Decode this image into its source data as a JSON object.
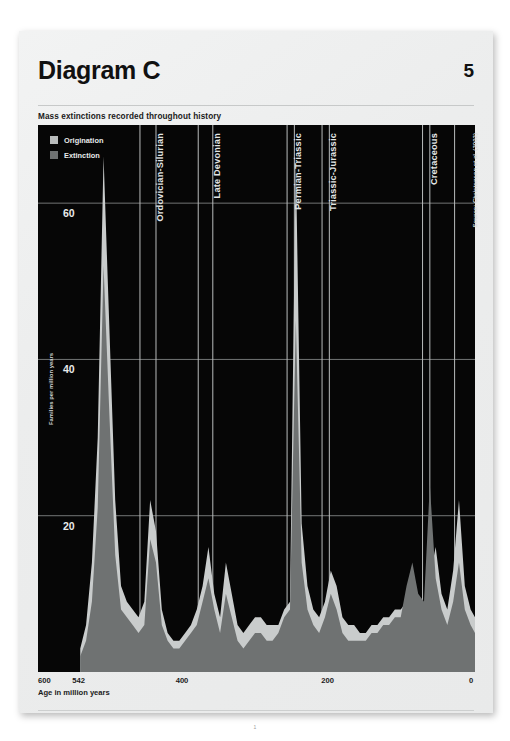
{
  "document": {
    "title": "Diagram C",
    "page_number": "5",
    "subtitle": "Mass extinctions recorded throughout history",
    "footer_page": "1"
  },
  "legend": {
    "items": [
      {
        "label": "Origination",
        "color": "#b9bcbc"
      },
      {
        "label": "Extinction",
        "color": "#6f7272"
      }
    ]
  },
  "annotations": {
    "source": "Source: Christensen et al. (2002)"
  },
  "colors": {
    "plot_background": "#060606",
    "gridline": "#8f9292",
    "band_separator": "#b9bcbc",
    "origination_fill": "#c9cccc",
    "extinction_fill": "#6f7272",
    "page_background": "#eceded",
    "text_dark": "#111111",
    "text_light": "#e4e6e6"
  },
  "chart_data": {
    "type": "area",
    "title": "Mass extinctions recorded throughout history",
    "xlabel": "Age in million years",
    "ylabel": "Families per million years",
    "xlim": [
      600,
      0
    ],
    "ylim": [
      0,
      70
    ],
    "x_reversed": true,
    "grid": "horizontal-and-vertical",
    "legend_position": "top-left-inside",
    "xticks": [
      600,
      542,
      400,
      200,
      0
    ],
    "yticks": [
      20,
      40,
      60
    ],
    "event_bands": [
      {
        "label": "Ordovician-Silurian",
        "start_ma": 460,
        "end_ma": 438
      },
      {
        "label": "Late Devonian",
        "start_ma": 380,
        "end_ma": 360
      },
      {
        "label": "Permian-Triassic",
        "start_ma": 258,
        "end_ma": 248
      },
      {
        "label": "Triassic-Jurassic",
        "start_ma": 210,
        "end_ma": 200
      },
      {
        "label": "Cretaceous",
        "start_ma": 72,
        "end_ma": 62
      }
    ],
    "x": [
      542,
      534,
      526,
      518,
      510,
      502,
      494,
      486,
      478,
      470,
      462,
      454,
      446,
      438,
      430,
      422,
      414,
      406,
      398,
      390,
      382,
      374,
      366,
      358,
      350,
      342,
      334,
      326,
      318,
      310,
      302,
      294,
      286,
      278,
      270,
      262,
      254,
      246,
      238,
      230,
      222,
      214,
      206,
      198,
      190,
      182,
      174,
      166,
      158,
      150,
      142,
      134,
      126,
      118,
      110,
      102,
      94,
      86,
      78,
      70,
      62,
      54,
      46,
      38,
      30,
      22,
      14,
      6,
      0
    ],
    "series": [
      {
        "name": "Origination",
        "color": "#c9cccc",
        "values": [
          3,
          6,
          14,
          30,
          66,
          44,
          22,
          11,
          9,
          8,
          7,
          9,
          22,
          18,
          8,
          5,
          4,
          4,
          5,
          6,
          8,
          11,
          16,
          10,
          7,
          14,
          10,
          6,
          5,
          6,
          7,
          7,
          6,
          6,
          6,
          8,
          9,
          66,
          19,
          11,
          8,
          7,
          9,
          13,
          11,
          7,
          6,
          6,
          5,
          5,
          6,
          6,
          7,
          7,
          8,
          8,
          9,
          8,
          7,
          8,
          12,
          16,
          10,
          8,
          13,
          22,
          11,
          8,
          7
        ]
      },
      {
        "name": "Extinction",
        "color": "#6f7272",
        "values": [
          2,
          4,
          9,
          21,
          52,
          33,
          15,
          8,
          7,
          6,
          5,
          6,
          17,
          14,
          6,
          4,
          3,
          3,
          4,
          5,
          6,
          9,
          12,
          8,
          5,
          10,
          7,
          4,
          3,
          4,
          5,
          5,
          4,
          4,
          5,
          7,
          8,
          45,
          14,
          8,
          6,
          5,
          7,
          10,
          8,
          5,
          4,
          4,
          4,
          4,
          5,
          5,
          6,
          6,
          7,
          7,
          11,
          14,
          10,
          9,
          24,
          12,
          8,
          6,
          9,
          14,
          8,
          6,
          5
        ]
      }
    ]
  }
}
